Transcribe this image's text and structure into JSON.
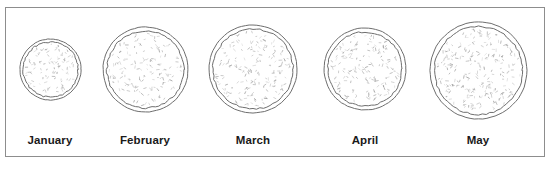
{
  "figure": {
    "border_color": "#8d8d8d",
    "background_color": "#ffffff",
    "ring_color": "#6e6e6e",
    "stipple_color": "#9a9a9a"
  },
  "chart_data": {
    "type": "bar",
    "xlabel": "",
    "ylabel": "Diameter (px)",
    "categories": [
      "January",
      "February",
      "March",
      "April",
      "May"
    ],
    "values": [
      61,
      85,
      88,
      82,
      97
    ],
    "ylim": [
      0,
      110
    ],
    "grid": false,
    "legend": null
  },
  "specimens": [
    {
      "label": "January",
      "center_x": 50,
      "center_y": 69,
      "outer_radius": 30.5,
      "inner_radius": 27.5,
      "stipple_density": 95,
      "label_x": -20,
      "label_y": 134
    },
    {
      "label": "February",
      "center_x": 145,
      "center_y": 69,
      "outer_radius": 42.5,
      "inner_radius": 38.5,
      "stipple_density": 150,
      "label_x": 75,
      "label_y": 134
    },
    {
      "label": "March",
      "center_x": 253,
      "center_y": 69,
      "outer_radius": 44.0,
      "inner_radius": 40.0,
      "stipple_density": 175,
      "label_x": 183,
      "label_y": 134
    },
    {
      "label": "April",
      "center_x": 365,
      "center_y": 69,
      "outer_radius": 41.0,
      "inner_radius": 37.0,
      "stipple_density": 160,
      "label_x": 295,
      "label_y": 134
    },
    {
      "label": "May",
      "center_x": 478,
      "center_y": 70,
      "outer_radius": 48.5,
      "inner_radius": 44.0,
      "stipple_density": 230,
      "label_x": 408,
      "label_y": 134
    }
  ]
}
